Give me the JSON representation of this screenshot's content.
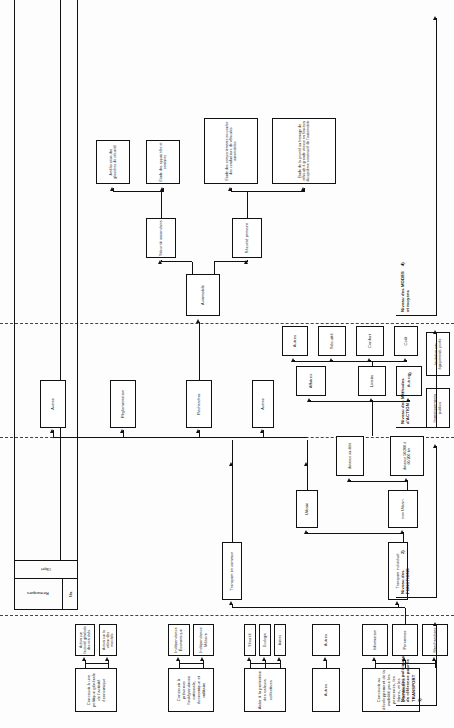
{
  "diagram": {
    "language": "fr",
    "orientation": "rotated-90",
    "levels": [
      {
        "id": "L1",
        "label": "Niveau des politiques\nde référence pour le\nTRANSPORT",
        "number": "1)"
      },
      {
        "id": "L2",
        "label": "Niveau des\nFONCTIONS",
        "number": "2)"
      },
      {
        "id": "L3",
        "label": "Niveau des Méthodes\nd'ACTION",
        "number": "3)"
      },
      {
        "id": "L4",
        "label": "Niveau des MODES\net moyens",
        "number": "4)"
      }
    ],
    "legend": {
      "col_no": "No.",
      "col_objet": "Objet",
      "col_remarques": "Remarques"
    },
    "nodes": [
      {
        "id": "n1",
        "label": "Concourir à une politique générale de l'activité économique"
      },
      {
        "id": "n2",
        "label": "Action sur l'activité générale des marchés"
      },
      {
        "id": "n3",
        "label": "Action sur la valeur des marchés"
      },
      {
        "id": "n4",
        "label": "Concourir à préserver l'indépendance nationale, économique et militaire"
      },
      {
        "id": "n5",
        "label": "Indépendance Économique"
      },
      {
        "id": "n6",
        "label": "Indépendance Militaire"
      },
      {
        "id": "n7",
        "label": "Aider à la protection des valeurs collectives"
      },
      {
        "id": "n8",
        "label": "Sécurité"
      },
      {
        "id": "n9",
        "label": "Écologie"
      },
      {
        "id": "n10",
        "label": "Autres"
      },
      {
        "id": "n11",
        "label": "Autres"
      },
      {
        "id": "n12",
        "label": "Autres"
      },
      {
        "id": "n13",
        "label": "Concourir au développement de la mobilité pour les personnes, les biens, et les informations"
      },
      {
        "id": "n14",
        "label": "Information"
      },
      {
        "id": "n15",
        "label": "Personnes"
      },
      {
        "id": "n16",
        "label": "Marchandises"
      },
      {
        "id": "n17",
        "label": "Transport en commun"
      },
      {
        "id": "n18",
        "label": "Transport individuel"
      },
      {
        "id": "n19",
        "label": "Urbain"
      },
      {
        "id": "n20",
        "label": "non Urbain"
      },
      {
        "id": "n21",
        "label": "distance au-delà"
      },
      {
        "id": "n22",
        "label": "distance 50/200 à 60/200 km"
      },
      {
        "id": "n23",
        "label": "Affaires"
      },
      {
        "id": "n24",
        "label": "Loisirs"
      },
      {
        "id": "n25",
        "label": "Autres"
      },
      {
        "id": "n26",
        "label": "Sécurité"
      },
      {
        "id": "n27",
        "label": "Confort"
      },
      {
        "id": "n28",
        "label": "Coût"
      },
      {
        "id": "n29",
        "label": "Investissements publics"
      },
      {
        "id": "n30",
        "label": "Incitation aux équipements privés"
      },
      {
        "id": "n31",
        "label": "Recherches"
      },
      {
        "id": "n32",
        "label": "Réglementation"
      },
      {
        "id": "n33",
        "label": "Autres"
      },
      {
        "id": "n34",
        "label": "Autres"
      },
      {
        "id": "n35",
        "label": "Automobile"
      },
      {
        "id": "n36",
        "label": "Sécurité primaire"
      },
      {
        "id": "n37",
        "label": "Sécurité secondaire"
      },
      {
        "id": "n38",
        "label": "Amélioration des glissières de sécurité"
      },
      {
        "id": "n39",
        "label": "Étude des appuis tête et ceintures"
      },
      {
        "id": "n40",
        "label": "Étude des comportements en courbe des conducteurs de véhicules automobiles"
      },
      {
        "id": "n41",
        "label": "Étude de la priorité au freinage de véhicule à grande vitesse en fonction du système constructif de l'automobile"
      }
    ]
  }
}
